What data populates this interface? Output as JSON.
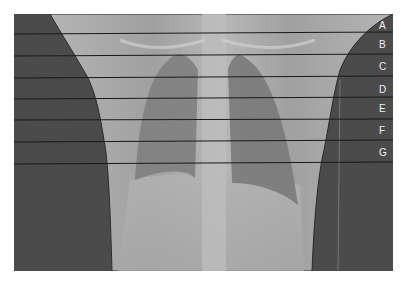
{
  "figure": {
    "colors": {
      "background_air": "#4a4a4a",
      "body": "#a9a9a9",
      "lung": "#7d7d7d",
      "line": "#1a1a1a",
      "label_text": "#f2f2f2"
    },
    "levels": [
      {
        "label": "A",
        "y_left": 34,
        "y_right": 32,
        "label_y": 26
      },
      {
        "label": "B",
        "y_left": 56,
        "y_right": 54,
        "label_y": 47
      },
      {
        "label": "C",
        "y_left": 78,
        "y_right": 76,
        "label_y": 69
      },
      {
        "label": "D",
        "y_left": 99,
        "y_right": 97,
        "label_y": 92
      },
      {
        "label": "E",
        "y_left": 120,
        "y_right": 119,
        "label_y": 111
      },
      {
        "label": "F",
        "y_left": 142,
        "y_right": 140,
        "label_y": 133
      },
      {
        "label": "G",
        "y_left": 164,
        "y_right": 162,
        "label_y": 155
      }
    ]
  }
}
